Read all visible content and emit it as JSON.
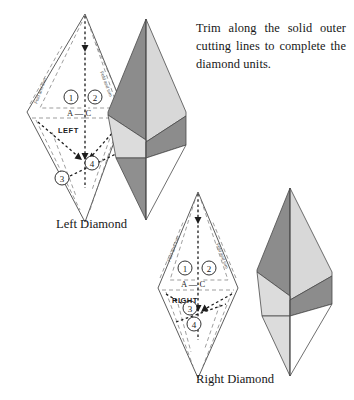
{
  "page": {
    "background_color": "#ffffff",
    "width": 354,
    "height": 400,
    "type": "quilting-pattern-instruction-diagram"
  },
  "instructions": {
    "text": "Trim along the solid outer cutting lines to complete the diamond units."
  },
  "captions": {
    "left_diamond": "Left Diamond",
    "right_diamond": "Right Diamond"
  },
  "left_pattern": {
    "orientation_label": "LEFT",
    "segment_label": "A — C",
    "point_a": "A",
    "point_c": "C",
    "numbers": [
      "1",
      "2",
      "3",
      "4"
    ],
    "fold_label_left": "Fold and trim",
    "fold_label_right": "Fold and trim"
  },
  "right_pattern": {
    "orientation_label": "RIGHT",
    "segment_label": "A — C",
    "point_a": "A",
    "point_c": "C",
    "numbers": [
      "1",
      "2",
      "3",
      "4"
    ],
    "fold_label_left": "Fold and trim",
    "fold_label_right": "Fold and trim"
  },
  "colors": {
    "outline": "#4a4a4a",
    "dashed_guide": "#6e6e6e",
    "arrow": "#1c1c1c",
    "shade_dark": "#8c8c8c",
    "shade_light": "#d4d4d4",
    "shade_white": "#ffffff",
    "text": "#171717"
  }
}
